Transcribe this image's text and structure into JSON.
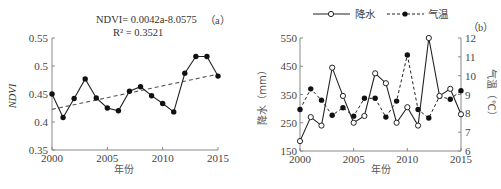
{
  "chart_data": [
    {
      "id": "a",
      "type": "line",
      "panel_label": "（a）",
      "title": "",
      "xlabel": "年份",
      "ylabel": "NDVI",
      "x": [
        2000,
        2001,
        2002,
        2003,
        2004,
        2005,
        2006,
        2007,
        2008,
        2009,
        2010,
        2011,
        2012,
        2013,
        2014,
        2015
      ],
      "xticks": [
        2000,
        2005,
        2010,
        2015
      ],
      "xlim": [
        2000,
        2015
      ],
      "ylim": [
        0.35,
        0.55
      ],
      "yticks": [
        0.35,
        0.4,
        0.45,
        0.5,
        0.55
      ],
      "ytick_labels": [
        "0.35",
        "0.4",
        "0.45",
        "0.5",
        "0.55"
      ],
      "grid": false,
      "series": [
        {
          "name": "NDVI",
          "style": "solid-line-filled-circle",
          "color": "#222222",
          "values": [
            0.45,
            0.408,
            0.442,
            0.477,
            0.443,
            0.425,
            0.42,
            0.455,
            0.463,
            0.447,
            0.433,
            0.418,
            0.487,
            0.517,
            0.517,
            0.482
          ]
        },
        {
          "name": "Linear trend",
          "style": "dashed-line",
          "color": "#555555",
          "x": [
            2000,
            2015
          ],
          "values": [
            0.4225,
            0.4855
          ]
        }
      ],
      "annotations": {
        "equation_line1": "NDVI= 0.0042a-8.0575",
        "equation_line2": "R² = 0.3521"
      }
    },
    {
      "id": "b",
      "type": "line",
      "panel_label": "（b）",
      "title": "",
      "xlabel": "年份",
      "ylabel": "降水（mm）",
      "ylabel_right": "气温（℃）",
      "x": [
        2000,
        2001,
        2002,
        2003,
        2004,
        2005,
        2006,
        2007,
        2008,
        2009,
        2010,
        2011,
        2012,
        2013,
        2014,
        2015
      ],
      "xticks": [
        2000,
        2005,
        2010,
        2015
      ],
      "xlim": [
        2000,
        2015
      ],
      "ylim": [
        150,
        550
      ],
      "yticks": [
        150,
        250,
        350,
        450,
        550
      ],
      "ylim_right": [
        6,
        12
      ],
      "yticks_right": [
        6,
        7,
        8,
        9,
        10,
        11,
        12
      ],
      "grid": false,
      "legend_position": "top",
      "series": [
        {
          "name": "降水",
          "axis": "left",
          "style": "solid-line-open-circle",
          "color": "#222222",
          "values": [
            185,
            270,
            240,
            445,
            345,
            250,
            274,
            425,
            390,
            250,
            305,
            240,
            550,
            345,
            370,
            280
          ]
        },
        {
          "name": "气温",
          "axis": "right",
          "style": "dashed-line-filled-circle",
          "color": "#222222",
          "values": [
            8.2,
            9.3,
            8.7,
            7.9,
            8.3,
            7.85,
            8.8,
            8.8,
            7.8,
            8.65,
            11.1,
            8.2,
            7.75,
            8.9,
            8.75,
            9.2
          ]
        }
      ]
    }
  ]
}
